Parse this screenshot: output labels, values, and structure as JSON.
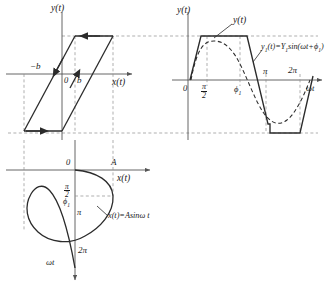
{
  "figure": {
    "line_color": "#2b2b2b",
    "dash_color": "#8d8d8d",
    "axis_color": "#555555"
  },
  "hysteresis_plot": {
    "name": "backlash-hysteresis-characteristic",
    "y_axis_label": "y(t)",
    "x_axis_label": "x(t)",
    "origin_label": "0",
    "neg_b_label": "−b",
    "pos_b_label": "b"
  },
  "output_plot": {
    "name": "trapezoidal-output-waveform",
    "y_axis_label": "y(t)",
    "x_axis_label": "ωt",
    "wave_label": "y(t)",
    "fundamental_label_parts": {
      "y1": "y",
      "y1_sub": "1",
      "mid": "(t)=Y",
      "Y_sub": "1",
      "sin": "sin(ωt+ϕ",
      "phi_sub": "1",
      "close": ")"
    },
    "fundamental_label": "y1(t)=Y1sin(ωt+ϕ1)",
    "ticks": [
      {
        "label": "0",
        "value": 0
      },
      {
        "label": "π/2",
        "value": 1.5708,
        "is_fraction": true,
        "num": "π",
        "den": "2"
      },
      {
        "label": "ϕ₁",
        "value": 2.2,
        "base": "ϕ",
        "sub": "1"
      },
      {
        "label": "π",
        "value": 3.1416
      },
      {
        "label": "2π",
        "value": 6.2832
      }
    ]
  },
  "input_plot": {
    "name": "sinusoidal-input-waveform",
    "x_axis_label": "x(t)",
    "time_axis_label": "ωt",
    "amplitude_label": "A",
    "origin_label": "0",
    "equation": "x(t)=Asinω t",
    "equation_parts": {
      "lhs": "x(t)=",
      "amp": "A",
      "fn": "sinω t"
    },
    "ticks": [
      {
        "label": "π/2",
        "value": 1.5708,
        "is_fraction": true,
        "num": "π",
        "den": "2"
      },
      {
        "label": "ϕ₁",
        "value": 2.2,
        "base": "ϕ",
        "sub": "1"
      },
      {
        "label": "π",
        "value": 3.1416
      },
      {
        "label": "2π",
        "value": 6.2832
      }
    ]
  }
}
